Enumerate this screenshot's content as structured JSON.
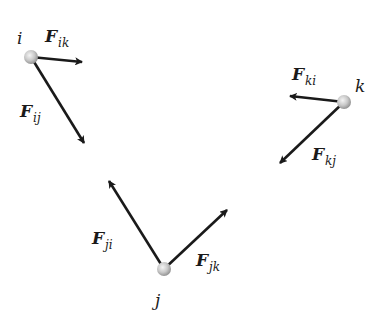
{
  "diagram": {
    "colors": {
      "arrow": "#1a1a1a",
      "particle_light": "#f2f2f2",
      "particle_dark": "#9a9a9a",
      "background": "#ffffff"
    },
    "particles": [
      {
        "id": "i",
        "label": "i",
        "x": 31,
        "y": 57,
        "label_x": 17,
        "label_y": 30
      },
      {
        "id": "j",
        "label": "j",
        "x": 164,
        "y": 269,
        "label_x": 155,
        "label_y": 292
      },
      {
        "id": "k",
        "label": "k",
        "x": 344,
        "y": 102,
        "label_x": 355,
        "label_y": 78
      }
    ],
    "forces": [
      {
        "id": "F_ik",
        "main": "F",
        "sub": "ik",
        "from": [
          31,
          57
        ],
        "to": [
          82,
          62
        ],
        "label_x": 45,
        "label_y": 28
      },
      {
        "id": "F_ij",
        "main": "F",
        "sub": "ij",
        "from": [
          31,
          57
        ],
        "to": [
          84,
          143
        ],
        "label_x": 20,
        "label_y": 103
      },
      {
        "id": "F_ki",
        "main": "F",
        "sub": "ki",
        "from": [
          344,
          102
        ],
        "to": [
          290,
          96
        ],
        "label_x": 292,
        "label_y": 66
      },
      {
        "id": "F_kj",
        "main": "F",
        "sub": "kj",
        "from": [
          344,
          102
        ],
        "to": [
          280,
          163
        ],
        "label_x": 312,
        "label_y": 146
      },
      {
        "id": "F_ji",
        "main": "F",
        "sub": "ji",
        "from": [
          164,
          269
        ],
        "to": [
          109,
          181
        ],
        "label_x": 92,
        "label_y": 230
      },
      {
        "id": "F_jk",
        "main": "F",
        "sub": "jk",
        "from": [
          164,
          269
        ],
        "to": [
          227,
          210
        ],
        "label_x": 196,
        "label_y": 252
      }
    ]
  }
}
